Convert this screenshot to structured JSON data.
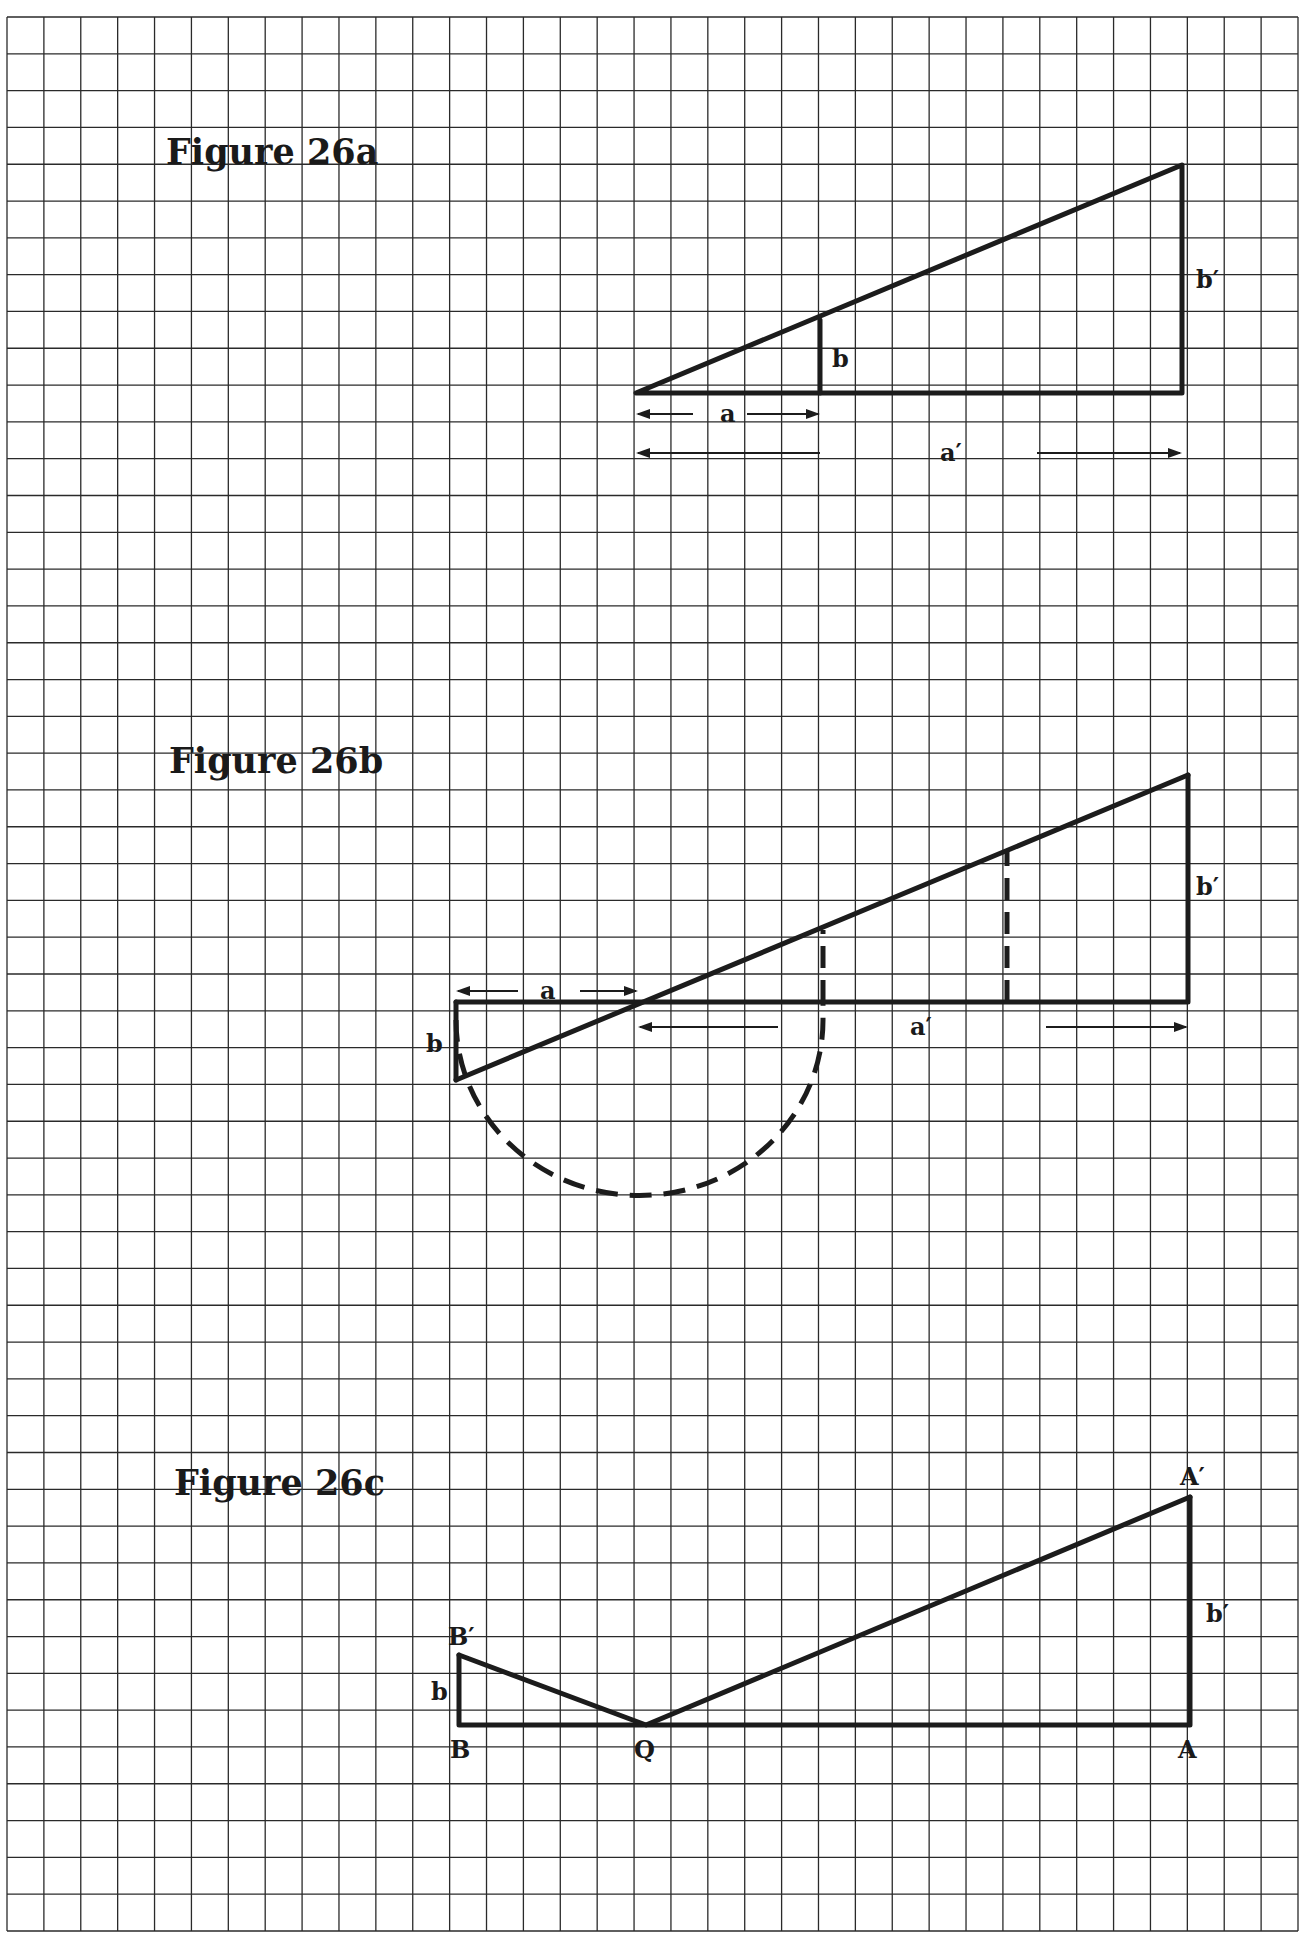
{
  "page": {
    "background": "#ffffff",
    "grid": {
      "x0": 7,
      "y0": 17,
      "x1": 1298,
      "y1": 1931,
      "cols": 35,
      "rows": 52,
      "line_color": "#2a2a2a"
    },
    "ink_color": "#1c1c1c"
  },
  "figures": [
    {
      "id": "26a",
      "title": "Figure 26a",
      "title_pos": [
        166,
        164
      ],
      "labels": {
        "a": "a",
        "b": "b",
        "a_prime": "a′",
        "b_prime": "b′"
      },
      "description": "Two similar right triangles sharing a vertex: small triangle legs a and b, large triangle legs a′ and b′."
    },
    {
      "id": "26b",
      "title": "Figure 26b",
      "title_pos": [
        169,
        773
      ],
      "labels": {
        "a": "a",
        "b": "b",
        "a_prime": "a′",
        "b_prime": "b′"
      },
      "description": "Small triangle flipped below the baseline; dashed semicircle of diameter a+b-extension with dashed perpendiculars."
    },
    {
      "id": "26c",
      "title": "Figure 26c",
      "title_pos": [
        174,
        1495
      ],
      "labels": {
        "B": "B",
        "B_prime": "B′",
        "Q": "Q",
        "A": "A",
        "A_prime": "A′",
        "b": "b",
        "b_prime": "b′"
      },
      "description": "Points B and A on a baseline with perpendiculars BB′ = b and AA′ = b′ joined to point Q."
    }
  ]
}
